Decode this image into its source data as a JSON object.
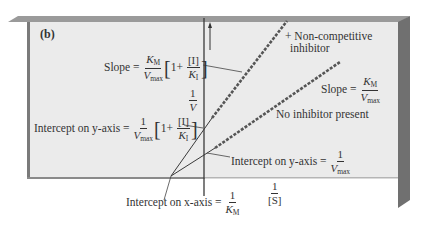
{
  "figure": {
    "panel_label": "(b)",
    "colors": {
      "panel_fill": "#ebebeb",
      "panel_edge": "#8a8a8a",
      "panel_edge_dark": "#6e6e6e",
      "line": "#3a3a3a",
      "data_line": "#555555"
    }
  },
  "axes": {
    "y_label_num": "1",
    "y_label_den": "V",
    "x_label_num": "1",
    "x_label_den": "[S]"
  },
  "series": {
    "inhibited": {
      "label_line1": "+ Non-competitive",
      "label_line2": "inhibitor"
    },
    "uninhibited": {
      "label": "No inhibitor present"
    }
  },
  "annotations": {
    "slope_inhibited": {
      "prefix": "Slope =",
      "num": "K",
      "num_sub": "M",
      "den": "V",
      "den_sub": "max",
      "bracket_one": "1+",
      "inner_num": "[I]",
      "inner_den": "K",
      "inner_den_sub": "I"
    },
    "intercept_y_inhibited": {
      "prefix": "Intercept on y-axis =",
      "num": "1",
      "den": "V",
      "den_sub": "max",
      "bracket_one": "1+",
      "inner_num": "[I]",
      "inner_den": "K",
      "inner_den_sub": "I"
    },
    "slope_uninhibited": {
      "prefix": "Slope =",
      "num": "K",
      "num_sub": "M",
      "den": "V",
      "den_sub": "max"
    },
    "intercept_y_uninhibited": {
      "prefix": "Intercept on y-axis =",
      "num": "1",
      "den": "V",
      "den_sub": "max"
    },
    "intercept_x": {
      "prefix": "Intercept on x-axis =",
      "num": "1",
      "den": "K",
      "den_sub": "M"
    }
  }
}
